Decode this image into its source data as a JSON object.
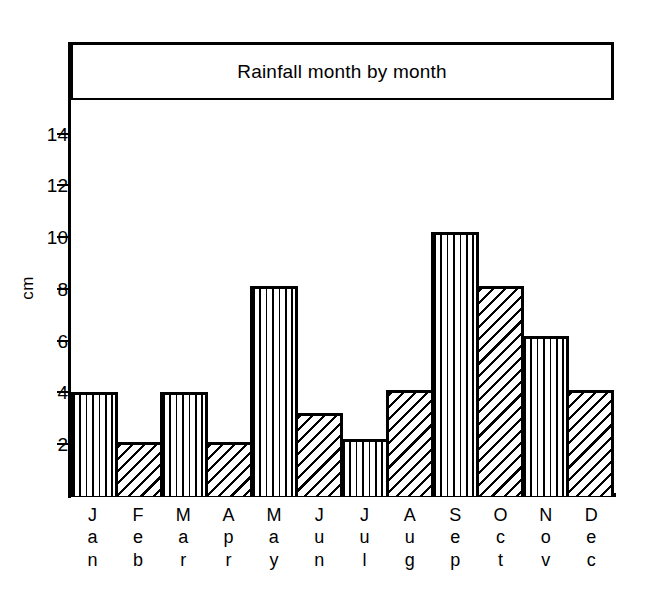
{
  "chart_data": {
    "type": "bar",
    "title": "Rainfall month by month",
    "xlabel": "",
    "ylabel": "cm",
    "categories": [
      "Jan",
      "Feb",
      "Mar",
      "Apr",
      "May",
      "Jun",
      "Jul",
      "Aug",
      "Sep",
      "Oct",
      "Nov",
      "Dec"
    ],
    "values": [
      4.0,
      2.1,
      4.0,
      2.1,
      8.1,
      3.2,
      2.2,
      4.1,
      10.2,
      8.1,
      6.2,
      4.1
    ],
    "ylim": [
      0,
      15.3
    ],
    "yticks": [
      2,
      4,
      6,
      8,
      10,
      12,
      14
    ],
    "ytick_labels": [
      "2",
      "4",
      "6",
      "8",
      "10",
      "12",
      "14"
    ],
    "grid": false,
    "legend": false,
    "bar_fills": [
      "vertical",
      "diagonal",
      "vertical",
      "diagonal",
      "vertical",
      "diagonal",
      "vertical",
      "diagonal",
      "vertical",
      "diagonal",
      "vertical",
      "diagonal"
    ]
  }
}
